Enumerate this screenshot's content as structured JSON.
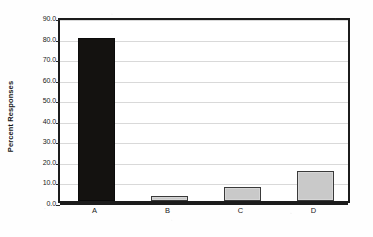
{
  "chart_data": {
    "type": "bar",
    "title": "",
    "subtitle": "",
    "xlabel": "",
    "ylabel": "Percent Responses",
    "categories": [
      "A",
      "B",
      "C",
      "D"
    ],
    "values": [
      79.5,
      2.5,
      7.0,
      14.5
    ],
    "series": [
      {
        "name": "Percent Responses",
        "values": [
          79.5,
          2.5,
          7.0,
          14.5
        ]
      }
    ],
    "ylim": [
      0.0,
      90.0
    ],
    "y_tick_step": 10.0,
    "y_tick_labels": [
      "90.0",
      "80.0",
      "70.0",
      "60.0",
      "50.0",
      "40.0",
      "30.0",
      "20.0",
      "10.0",
      "0.0"
    ],
    "y_tick_values": [
      90.0,
      80.0,
      70.0,
      60.0,
      50.0,
      40.0,
      30.0,
      20.0,
      10.0,
      0.0
    ],
    "x_tick_labels": [
      "A",
      "B",
      "C",
      "D"
    ],
    "grid": true,
    "grid_axis": "y",
    "legend": false,
    "legend_position": "none",
    "bar_colors": [
      "#141210",
      "#c9c9c9",
      "#c9c9c9",
      "#c9c9c9"
    ],
    "bar_border_color": "#3a3a3a",
    "gridline_color": "#d9d9d9",
    "axis_color": "#1c1c1c",
    "plot_background": "#ffffff",
    "figure_background": "#fefefe",
    "annotations": []
  }
}
